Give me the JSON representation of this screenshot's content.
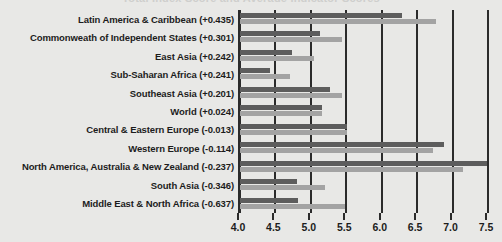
{
  "chart_data": {
    "type": "bar",
    "orientation": "horizontal",
    "title": "Total Index Score and Average Indicator Scores",
    "xlabel": "",
    "ylabel": "",
    "xlim": [
      4.0,
      7.5
    ],
    "xticks": [
      4.0,
      4.5,
      5.0,
      5.5,
      6.0,
      6.5,
      7.0,
      7.5
    ],
    "xticklabels": [
      "4.0",
      "4.5",
      "5.0",
      "5.5",
      "6.0",
      "6.5",
      "7.0",
      "7.5"
    ],
    "grid": true,
    "legend": "none",
    "categories": [
      "Latin America & Caribbean (+0.435)",
      "Commonweath of Independent States (+0.301)",
      "East Asia (+0.242)",
      "Sub-Saharan Africa (+0.241)",
      "Southeast Asia (+0.201)",
      "World (+0.024)",
      "Central & Eastern Europe (-0.013)",
      "Western Europe (-0.114)",
      "North America, Australia & New Zealand (-0.237)",
      "South Asia (-0.346)",
      "Middle East & North Africa (-0.637)"
    ],
    "series": [
      {
        "name": "dark-series",
        "color": "#5d5d5d",
        "values": [
          6.28,
          5.13,
          4.74,
          4.42,
          5.27,
          5.16,
          5.51,
          6.88,
          7.48,
          4.8,
          4.82
        ]
      },
      {
        "name": "light-series",
        "color": "#a3a3a3",
        "values": [
          6.76,
          5.44,
          5.05,
          4.7,
          5.44,
          5.16,
          5.51,
          6.72,
          7.15,
          5.2,
          5.48
        ]
      }
    ]
  }
}
